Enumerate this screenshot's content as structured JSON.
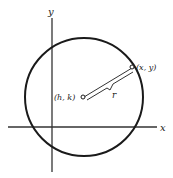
{
  "diagram": {
    "axes": {
      "x_label": "x",
      "y_label": "y"
    },
    "center": {
      "label": "(h, k)"
    },
    "point": {
      "label": "(x, y)"
    },
    "radius": {
      "label": "r"
    },
    "colors": {
      "stroke": "#1a1a1a",
      "background": "#ffffff"
    }
  }
}
